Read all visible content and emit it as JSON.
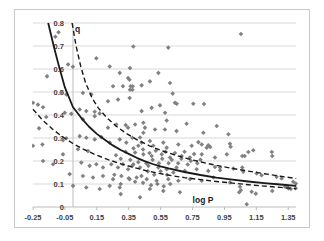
{
  "chart_data": {
    "type": "scatter",
    "title": "",
    "xlabel": "log P",
    "ylabel": "q",
    "xlim": [
      -0.25,
      1.4
    ],
    "ylim": [
      0,
      0.8
    ],
    "grid": true,
    "legend": "none",
    "marker": "diamond",
    "colors": {
      "point": "#818181",
      "fit_line": "#1a1a1a",
      "band_line": "#1a1a1a",
      "gridline": "#d9d9d9",
      "axis_line": "#bdbdbd",
      "frame_border": "#c9c9c9",
      "tick_label": "#3f3f3f",
      "background": "#ffffff"
    },
    "x_ticks": {
      "values": [
        -0.25,
        -0.05,
        0.15,
        0.35,
        0.55,
        0.75,
        0.95,
        1.15,
        1.35
      ],
      "labels": [
        "-0.25",
        "-0.05",
        "0.15",
        "0.35",
        "0.55",
        "0.75",
        "0.95",
        "1.15",
        "1.35"
      ]
    },
    "y_ticks": {
      "values": [
        0,
        0.1,
        0.2,
        0.3,
        0.4,
        0.5,
        0.6,
        0.7,
        0.8
      ],
      "labels": [
        "0",
        "0.1",
        "0.2",
        "0.3",
        "0.4",
        "0.5",
        "0.6",
        "0.7",
        "0.8"
      ]
    },
    "series": [
      {
        "name": "observations",
        "kind": "scatter",
        "points": [
          [
            -0.25,
            0.453
          ],
          [
            -0.25,
            0.266
          ],
          [
            -0.219,
            0.445
          ],
          [
            -0.212,
            0.342
          ],
          [
            -0.191,
            0.272
          ],
          [
            -0.187,
            0.434
          ],
          [
            -0.187,
            0.2
          ],
          [
            -0.167,
            0.391
          ],
          [
            -0.162,
            0.568
          ],
          [
            -0.124,
            0.186
          ],
          [
            -0.11,
            0.74
          ],
          [
            -0.09,
            0.76
          ],
          [
            -0.072,
            0.496
          ],
          [
            -0.062,
            0.29
          ],
          [
            -0.062,
            0.229
          ],
          [
            -0.051,
            0.41
          ],
          [
            -0.041,
            0.489
          ],
          [
            -0.041,
            0.299
          ],
          [
            -0.03,
            0.62
          ],
          [
            -0.02,
            0.143
          ],
          [
            -0.01,
            0.405
          ],
          [
            0.0,
            0.61
          ],
          [
            0.001,
            0.092
          ],
          [
            0.032,
            0.251
          ],
          [
            0.043,
            0.424
          ],
          [
            0.043,
            0.308
          ],
          [
            0.053,
            0.193
          ],
          [
            0.063,
            0.496
          ],
          [
            0.063,
            0.381
          ],
          [
            0.063,
            0.135
          ],
          [
            0.084,
            0.417
          ],
          [
            0.084,
            0.301
          ],
          [
            0.084,
            0.085
          ],
          [
            0.095,
            0.243
          ],
          [
            0.105,
            0.179
          ],
          [
            0.116,
            0.489
          ],
          [
            0.126,
            0.128
          ],
          [
            0.137,
            0.414
          ],
          [
            0.137,
            0.395
          ],
          [
            0.137,
            0.294
          ],
          [
            0.147,
            0.647
          ],
          [
            0.147,
            0.186
          ],
          [
            0.168,
            0.407
          ],
          [
            0.168,
            0.078
          ],
          [
            0.178,
            0.304
          ],
          [
            0.189,
            0.172
          ],
          [
            0.189,
            0.135
          ],
          [
            0.22,
            0.46
          ],
          [
            0.22,
            0.345
          ],
          [
            0.231,
            0.611
          ],
          [
            0.231,
            0.28
          ],
          [
            0.231,
            0.092
          ],
          [
            0.241,
            0.186
          ],
          [
            0.252,
            0.525
          ],
          [
            0.252,
            0.121
          ],
          [
            0.26,
            0.14
          ],
          [
            0.27,
            0.225
          ],
          [
            0.272,
            0.359
          ],
          [
            0.283,
            0.467
          ],
          [
            0.283,
            0.172
          ],
          [
            0.294,
            0.583
          ],
          [
            0.294,
            0.294
          ],
          [
            0.294,
            0.085
          ],
          [
            0.3,
            0.21
          ],
          [
            0.3,
            0.1
          ],
          [
            0.3,
            0.056
          ],
          [
            0.304,
            0.135
          ],
          [
            0.314,
            0.525
          ],
          [
            0.314,
            0.186
          ],
          [
            0.33,
            0.24
          ],
          [
            0.331,
            0.356
          ],
          [
            0.335,
            0.28
          ],
          [
            0.346,
            0.561
          ],
          [
            0.346,
            0.345
          ],
          [
            0.346,
            0.164
          ],
          [
            0.35,
            0.125
          ],
          [
            0.355,
            0.553
          ],
          [
            0.356,
            0.474
          ],
          [
            0.356,
            0.121
          ],
          [
            0.358,
            0.604
          ],
          [
            0.358,
            0.51
          ],
          [
            0.36,
            0.205
          ],
          [
            0.362,
            0.525
          ],
          [
            0.373,
            0.51
          ],
          [
            0.373,
            0.301
          ],
          [
            0.373,
            0.179
          ],
          [
            0.375,
            0.525
          ],
          [
            0.379,
            0.698
          ],
          [
            0.379,
            0.186
          ],
          [
            0.38,
            0.255
          ],
          [
            0.39,
            0.359
          ],
          [
            0.39,
            0.237
          ],
          [
            0.39,
            0.11
          ],
          [
            0.4,
            0.128
          ],
          [
            0.41,
            0.266
          ],
          [
            0.41,
            0.195
          ],
          [
            0.421,
            0.302
          ],
          [
            0.421,
            0.172
          ],
          [
            0.421,
            0.042
          ],
          [
            0.43,
            0.135
          ],
          [
            0.431,
            0.529
          ],
          [
            0.431,
            0.417
          ],
          [
            0.431,
            0.28
          ],
          [
            0.44,
            0.25
          ],
          [
            0.44,
            0.105
          ],
          [
            0.442,
            0.366
          ],
          [
            0.442,
            0.323
          ],
          [
            0.442,
            0.229
          ],
          [
            0.452,
            0.345
          ],
          [
            0.46,
            0.19
          ],
          [
            0.463,
            0.121
          ],
          [
            0.47,
            0.155
          ],
          [
            0.473,
            0.179
          ],
          [
            0.48,
            0.235
          ],
          [
            0.483,
            0.546
          ],
          [
            0.483,
            0.287
          ],
          [
            0.483,
            0.078
          ],
          [
            0.49,
            0.095
          ],
          [
            0.494,
            0.431
          ],
          [
            0.494,
            0.222
          ],
          [
            0.5,
            0.205
          ],
          [
            0.504,
            0.266
          ],
          [
            0.51,
            0.14
          ],
          [
            0.515,
            0.337
          ],
          [
            0.52,
            0.245
          ],
          [
            0.525,
            0.114
          ],
          [
            0.53,
            0.1
          ],
          [
            0.536,
            0.583
          ],
          [
            0.536,
            0.172
          ],
          [
            0.54,
            0.19
          ],
          [
            0.546,
            0.442
          ],
          [
            0.55,
            0.155
          ],
          [
            0.557,
            0.229
          ],
          [
            0.56,
            0.21
          ],
          [
            0.567,
            0.28
          ],
          [
            0.567,
            0.07
          ],
          [
            0.57,
            0.09
          ],
          [
            0.577,
            0.337
          ],
          [
            0.578,
            0.41
          ],
          [
            0.58,
            0.24
          ],
          [
            0.588,
            0.376
          ],
          [
            0.588,
            0.258
          ],
          [
            0.588,
            0.164
          ],
          [
            0.59,
            0.14
          ],
          [
            0.598,
            0.693
          ],
          [
            0.598,
            0.121
          ],
          [
            0.6,
            0.19
          ],
          [
            0.609,
            0.539
          ],
          [
            0.609,
            0.215
          ],
          [
            0.61,
            0.1
          ],
          [
            0.62,
            0.205
          ],
          [
            0.626,
            0.493
          ],
          [
            0.63,
            0.15
          ],
          [
            0.64,
            0.453
          ],
          [
            0.64,
            0.235
          ],
          [
            0.65,
            0.33
          ],
          [
            0.65,
            0.172
          ],
          [
            0.651,
            0.449
          ],
          [
            0.66,
            0.19
          ],
          [
            0.661,
            0.272
          ],
          [
            0.661,
            0.114
          ],
          [
            0.671,
            0.064
          ],
          [
            0.68,
            0.21
          ],
          [
            0.682,
            0.222
          ],
          [
            0.7,
            0.24
          ],
          [
            0.702,
            0.157
          ],
          [
            0.713,
            0.362
          ],
          [
            0.72,
            0.185
          ],
          [
            0.734,
            0.215
          ],
          [
            0.734,
            0.121
          ],
          [
            0.74,
            0.2
          ],
          [
            0.745,
            0.266
          ],
          [
            0.755,
            0.449
          ],
          [
            0.76,
            0.23
          ],
          [
            0.776,
            0.164
          ],
          [
            0.78,
            0.19
          ],
          [
            0.787,
            0.282
          ],
          [
            0.8,
            0.205
          ],
          [
            0.808,
            0.272
          ],
          [
            0.808,
            0.229
          ],
          [
            0.808,
            0.114
          ],
          [
            0.818,
            0.323
          ],
          [
            0.822,
            0.448
          ],
          [
            0.839,
            0.258
          ],
          [
            0.849,
            0.268
          ],
          [
            0.849,
            0.157
          ],
          [
            0.861,
            0.261
          ],
          [
            0.881,
            0.128
          ],
          [
            0.891,
            0.215
          ],
          [
            0.891,
            0.174
          ],
          [
            0.902,
            0.352
          ],
          [
            0.923,
            0.172
          ],
          [
            0.923,
            0.16
          ],
          [
            0.965,
            0.229
          ],
          [
            0.975,
            0.316
          ],
          [
            0.985,
            0.275
          ],
          [
            0.985,
            0.107
          ],
          [
            0.989,
            0.262
          ],
          [
            1.006,
            0.167
          ],
          [
            1.043,
            0.064
          ],
          [
            1.048,
            0.088
          ],
          [
            1.053,
            0.073
          ],
          [
            1.054,
            0.752
          ],
          [
            1.062,
            0.222
          ],
          [
            1.062,
            0.172
          ],
          [
            1.068,
            0.153
          ],
          [
            1.077,
            0.222
          ],
          [
            1.09,
            0.012
          ],
          [
            1.1,
            0.239
          ],
          [
            1.121,
            0.066
          ],
          [
            1.131,
            0.247
          ],
          [
            1.147,
            0.058
          ],
          [
            1.152,
            0.146
          ],
          [
            1.183,
            0.138
          ],
          [
            1.247,
            0.239
          ],
          [
            1.25,
            0.222
          ],
          [
            1.25,
            0.07
          ],
          [
            1.277,
            0.131
          ],
          [
            1.309,
            0.124
          ],
          [
            1.33,
            0.088
          ],
          [
            1.344,
            0.088
          ],
          [
            1.351,
            0.081
          ],
          [
            1.366,
            0.078
          ],
          [
            1.381,
            0.11
          ],
          [
            1.397,
            0.082
          ],
          [
            1.398,
            0.102
          ]
        ]
      },
      {
        "name": "fit-curve",
        "kind": "line",
        "style": "solid",
        "points": [
          [
            -0.155,
            0.8
          ],
          [
            -0.12,
            0.7
          ],
          [
            -0.09,
            0.62
          ],
          [
            -0.05,
            0.52
          ],
          [
            0.0,
            0.435
          ],
          [
            0.05,
            0.39
          ],
          [
            0.1,
            0.35
          ],
          [
            0.15,
            0.318
          ],
          [
            0.2,
            0.292
          ],
          [
            0.25,
            0.268
          ],
          [
            0.3,
            0.248
          ],
          [
            0.35,
            0.231
          ],
          [
            0.4,
            0.214
          ],
          [
            0.45,
            0.199
          ],
          [
            0.5,
            0.187
          ],
          [
            0.55,
            0.177
          ],
          [
            0.6,
            0.168
          ],
          [
            0.7,
            0.152
          ],
          [
            0.8,
            0.139
          ],
          [
            0.9,
            0.128
          ],
          [
            1.0,
            0.119
          ],
          [
            1.1,
            0.111
          ],
          [
            1.2,
            0.104
          ],
          [
            1.3,
            0.098
          ],
          [
            1.4,
            0.092
          ]
        ]
      },
      {
        "name": "upper-confidence-band",
        "kind": "line",
        "style": "dashed",
        "points": [
          [
            -0.005,
            0.8
          ],
          [
            0.02,
            0.7
          ],
          [
            0.05,
            0.61
          ],
          [
            0.08,
            0.54
          ],
          [
            0.12,
            0.475
          ],
          [
            0.16,
            0.43
          ],
          [
            0.21,
            0.39
          ],
          [
            0.27,
            0.352
          ],
          [
            0.33,
            0.322
          ],
          [
            0.4,
            0.293
          ],
          [
            0.48,
            0.266
          ],
          [
            0.56,
            0.244
          ],
          [
            0.64,
            0.226
          ],
          [
            0.72,
            0.21
          ],
          [
            0.8,
            0.196
          ],
          [
            0.9,
            0.181
          ],
          [
            1.0,
            0.168
          ],
          [
            1.1,
            0.156
          ],
          [
            1.2,
            0.145
          ],
          [
            1.3,
            0.134
          ],
          [
            1.4,
            0.124
          ]
        ]
      },
      {
        "name": "lower-confidence-band",
        "kind": "line",
        "style": "dashed",
        "points": [
          [
            -0.25,
            0.425
          ],
          [
            -0.19,
            0.378
          ],
          [
            -0.13,
            0.34
          ],
          [
            -0.07,
            0.308
          ],
          [
            0.0,
            0.276
          ],
          [
            0.07,
            0.25
          ],
          [
            0.14,
            0.228
          ],
          [
            0.22,
            0.206
          ],
          [
            0.3,
            0.188
          ],
          [
            0.38,
            0.172
          ],
          [
            0.46,
            0.158
          ],
          [
            0.54,
            0.146
          ],
          [
            0.62,
            0.136
          ],
          [
            0.7,
            0.128
          ],
          [
            0.8,
            0.119
          ],
          [
            0.9,
            0.111
          ],
          [
            1.0,
            0.104
          ],
          [
            1.1,
            0.097
          ],
          [
            1.2,
            0.091
          ],
          [
            1.3,
            0.085
          ],
          [
            1.4,
            0.079
          ]
        ]
      }
    ]
  }
}
